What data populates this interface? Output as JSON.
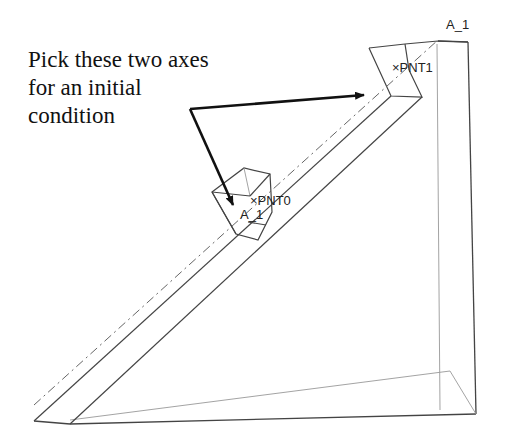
{
  "callout": {
    "lines": [
      "Pick these two axes",
      "for an initial",
      "condition"
    ]
  },
  "labels": {
    "axis_top": "A_1",
    "point_top": "×PNT1",
    "point_block": "×PNT0",
    "axis_block": "A_1"
  },
  "colors": {
    "background": "#ffffff",
    "edges": "#444444",
    "hidden_edges": "#9a9a9a",
    "arrow": "#111111",
    "text": "#111111"
  }
}
